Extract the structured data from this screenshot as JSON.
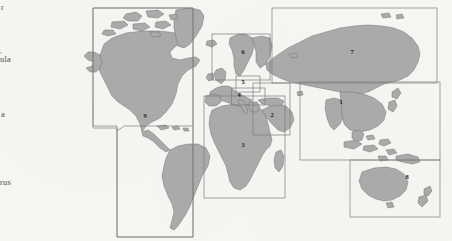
{
  "figure": {
    "type": "world-map-regional-divisions",
    "background_color": "#f7f6f3",
    "land_color": "#aaaaaa",
    "land_outline_color": "#6b6b6b",
    "box_outline_color": "#7d7d7d",
    "label_color": "#1d1d1d"
  },
  "margin_text_fragments": [
    {
      "id": "frag-0",
      "text": "r"
    },
    {
      "id": "frag-1",
      "text": ","
    },
    {
      "id": "frag-2",
      "text": "ula"
    },
    {
      "id": "frag-3",
      "text": "a"
    },
    {
      "id": "frag-4",
      "text": "rus"
    }
  ],
  "regions": [
    {
      "id": "region-1",
      "label": "1",
      "label_x": 341,
      "label_y": 103,
      "box": {
        "x": 300.0,
        "y": 82.0,
        "w": 140.0,
        "h": 78.0
      }
    },
    {
      "id": "region-2",
      "label": "2",
      "label_x": 272,
      "label_y": 116,
      "box": {
        "x": 253.0,
        "y": 83.0,
        "w": 37.0,
        "h": 52.0
      }
    },
    {
      "id": "region-3",
      "label": "3",
      "label_x": 243,
      "label_y": 146,
      "box": {
        "x": 204.0,
        "y": 96.0,
        "w": 81.0,
        "h": 102.0
      }
    },
    {
      "id": "region-4",
      "label": "4",
      "label_x": 239,
      "label_y": 96,
      "box": {
        "x": 231.5,
        "y": 88.0,
        "w": 33.5,
        "h": 17.0
      }
    },
    {
      "id": "region-5",
      "label": "5",
      "label_x": 243,
      "label_y": 83,
      "box": {
        "x": 236.0,
        "y": 76.0,
        "w": 24.0,
        "h": 16.0
      }
    },
    {
      "id": "region-6",
      "label": "6",
      "label_x": 243,
      "label_y": 53,
      "box": {
        "x": 212.0,
        "y": 34.0,
        "w": 58.0,
        "h": 46.0
      }
    },
    {
      "id": "region-7",
      "label": "7",
      "label_x": 352,
      "label_y": 53,
      "box": {
        "x": 272.0,
        "y": 8.0,
        "w": 165.0,
        "h": 75.0
      }
    },
    {
      "id": "region-8",
      "label": "8",
      "label_x": 407,
      "label_y": 178,
      "box": {
        "x": 350.0,
        "y": 160.0,
        "w": 90.0,
        "h": 57.0
      }
    },
    {
      "id": "region-9",
      "label": "9",
      "label_x": 145,
      "label_y": 117,
      "box": {
        "x": 0,
        "y": 0,
        "w": 0,
        "h": 0
      }
    }
  ],
  "region_9_outline": "M 31,8 L 193,8 L 193,126 L 124,126 L 117,128 L 31,128 Z",
  "counts": {
    "regions_total": 9,
    "margin_fragments_total": 5
  }
}
